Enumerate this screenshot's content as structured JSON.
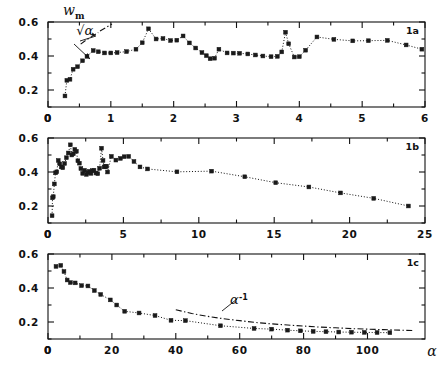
{
  "figure": {
    "title": "",
    "y_axis_label": "w",
    "y_axis_label_sub": "m",
    "x_axis_label": "α",
    "panels": [
      "1a",
      "1b",
      "1c"
    ]
  },
  "chart_data": [
    {
      "type": "scatter",
      "panel": "1a",
      "title": "",
      "xlabel": "",
      "ylabel": "w_m",
      "xlim": [
        0,
        6
      ],
      "ylim": [
        0.1,
        0.6
      ],
      "xticks": [
        0,
        1,
        2,
        3,
        4,
        5,
        6
      ],
      "xticklabels": [
        "0",
        "1",
        "2",
        "3",
        "4",
        "5",
        "6"
      ],
      "yticks": [
        0.2,
        0.4,
        0.6
      ],
      "yticklabels": [
        "0.2",
        "0.4",
        "0.6"
      ],
      "yminorticks": [
        0.1,
        0.3,
        0.5
      ],
      "grid": false,
      "legend": false,
      "annotations": [
        {
          "text": "√α",
          "x": 0.45,
          "y": 0.525,
          "kind": "guide-label"
        }
      ],
      "guide_line": {
        "label": "sqrt(alpha)",
        "style": "dash-dot",
        "x": [
          0.52,
          0.62,
          0.72,
          0.8
        ],
        "y": [
          0.47,
          0.497,
          0.52,
          0.538
        ]
      },
      "series": [
        {
          "name": "w_m",
          "marker": "square",
          "line": "dotted",
          "x": [
            0.27,
            0.3,
            0.35,
            0.4,
            0.47,
            0.55,
            0.62,
            0.72,
            0.8,
            0.9,
            1.0,
            1.1,
            1.25,
            1.4,
            1.5,
            1.6,
            1.72,
            1.83,
            1.95,
            2.05,
            2.15,
            2.25,
            2.35,
            2.45,
            2.52,
            2.58,
            2.65,
            2.72,
            2.85,
            2.95,
            3.05,
            3.18,
            3.3,
            3.42,
            3.55,
            3.65,
            3.72,
            3.78,
            3.83,
            3.92,
            4.0,
            4.1,
            4.28,
            4.55,
            4.85,
            5.1,
            5.4,
            5.7,
            5.95
          ],
          "y": [
            0.165,
            0.257,
            0.263,
            0.322,
            0.337,
            0.372,
            0.398,
            0.432,
            0.425,
            0.418,
            0.418,
            0.42,
            0.426,
            0.44,
            0.478,
            0.56,
            0.5,
            0.503,
            0.491,
            0.493,
            0.518,
            0.477,
            0.447,
            0.42,
            0.402,
            0.384,
            0.387,
            0.44,
            0.418,
            0.417,
            0.416,
            0.412,
            0.406,
            0.4,
            0.396,
            0.398,
            0.424,
            0.54,
            0.472,
            0.394,
            0.396,
            0.434,
            0.512,
            0.498,
            0.489,
            0.49,
            0.492,
            0.465,
            0.44
          ]
        }
      ]
    },
    {
      "type": "scatter",
      "panel": "1b",
      "title": "",
      "xlabel": "",
      "ylabel": "w_m",
      "xlim": [
        0,
        25
      ],
      "ylim": [
        0.1,
        0.6
      ],
      "xticks": [
        0,
        5,
        10,
        15,
        20,
        25
      ],
      "xticklabels": [
        "0",
        "5",
        "10",
        "15",
        "20",
        "25"
      ],
      "yticks": [
        0.2,
        0.4,
        0.6
      ],
      "yticklabels": [
        "0.2",
        "0.4",
        "0.6"
      ],
      "yminorticks": [
        0.1,
        0.3,
        0.5
      ],
      "grid": false,
      "legend": false,
      "annotations": [],
      "series": [
        {
          "name": "w_m",
          "marker": "square",
          "line": "dotted",
          "x": [
            0.27,
            0.3,
            0.35,
            0.42,
            0.5,
            0.58,
            0.68,
            0.78,
            0.88,
            0.98,
            1.1,
            1.22,
            1.35,
            1.48,
            1.58,
            1.68,
            1.78,
            1.88,
            1.98,
            2.08,
            2.18,
            2.3,
            2.42,
            2.55,
            2.65,
            2.75,
            2.85,
            2.95,
            3.05,
            3.18,
            3.3,
            3.42,
            3.55,
            3.65,
            3.72,
            3.8,
            3.88,
            3.95,
            4.2,
            4.5,
            4.8,
            5.05,
            5.35,
            5.7,
            6.1,
            6.6,
            8.55,
            10.85,
            13.05,
            15.1,
            17.3,
            19.4,
            21.6,
            23.9
          ],
          "y": [
            0.143,
            0.248,
            0.255,
            0.33,
            0.395,
            0.401,
            0.468,
            0.448,
            0.43,
            0.425,
            0.45,
            0.484,
            0.512,
            0.56,
            0.5,
            0.507,
            0.533,
            0.522,
            0.466,
            0.452,
            0.42,
            0.392,
            0.41,
            0.386,
            0.397,
            0.404,
            0.392,
            0.408,
            0.41,
            0.394,
            0.39,
            0.422,
            0.54,
            0.468,
            0.43,
            0.432,
            0.434,
            0.4,
            0.492,
            0.47,
            0.48,
            0.49,
            0.492,
            0.462,
            0.43,
            0.418,
            0.401,
            0.405,
            0.372,
            0.337,
            0.312,
            0.277,
            0.245,
            0.2
          ]
        }
      ]
    },
    {
      "type": "scatter",
      "panel": "1c",
      "title": "",
      "xlabel": "α",
      "ylabel": "w_m",
      "xlim": [
        0,
        118
      ],
      "ylim": [
        0.1,
        0.6
      ],
      "xticks": [
        0,
        20,
        40,
        60,
        80,
        100
      ],
      "xticklabels": [
        "0",
        "20",
        "40",
        "60",
        "80",
        "100"
      ],
      "yticks": [
        0.2,
        0.4,
        0.6
      ],
      "yticklabels": [
        "0.2",
        "0.4",
        "0.6"
      ],
      "yminorticks": [
        0.1,
        0.3,
        0.5
      ],
      "grid": false,
      "legend": false,
      "annotations": [
        {
          "text": "α",
          "sup": "-1",
          "x": 57,
          "y": 0.305,
          "kind": "guide-label"
        }
      ],
      "guide_line": {
        "label": "alpha^-1",
        "style": "dash-dot",
        "x": [
          40,
          45,
          50,
          55,
          60,
          65,
          70,
          75,
          80,
          85,
          90,
          95,
          100,
          105,
          110,
          114
        ],
        "y": [
          0.272,
          0.25,
          0.233,
          0.219,
          0.208,
          0.197,
          0.189,
          0.182,
          0.176,
          0.17,
          0.166,
          0.161,
          0.158,
          0.155,
          0.152,
          0.15
        ]
      },
      "series": [
        {
          "name": "w_m",
          "marker": "square",
          "line": "dotted",
          "x": [
            2.5,
            4.0,
            5.0,
            6.0,
            7.0,
            8.5,
            10.5,
            12.5,
            14.5,
            16.5,
            19.5,
            21.5,
            24.0,
            28.5,
            33.5,
            38.5,
            43.0,
            54.0,
            64.5,
            70.0,
            75.0,
            79.0,
            83.0,
            87.0,
            91.0,
            95.0,
            99.0,
            103.0,
            107.0
          ],
          "y": [
            0.527,
            0.533,
            0.497,
            0.447,
            0.432,
            0.43,
            0.414,
            0.412,
            0.385,
            0.362,
            0.33,
            0.3,
            0.263,
            0.253,
            0.238,
            0.21,
            0.208,
            0.178,
            0.162,
            0.158,
            0.152,
            0.148,
            0.145,
            0.143,
            0.141,
            0.14,
            0.139,
            0.138,
            0.137
          ]
        }
      ]
    }
  ]
}
